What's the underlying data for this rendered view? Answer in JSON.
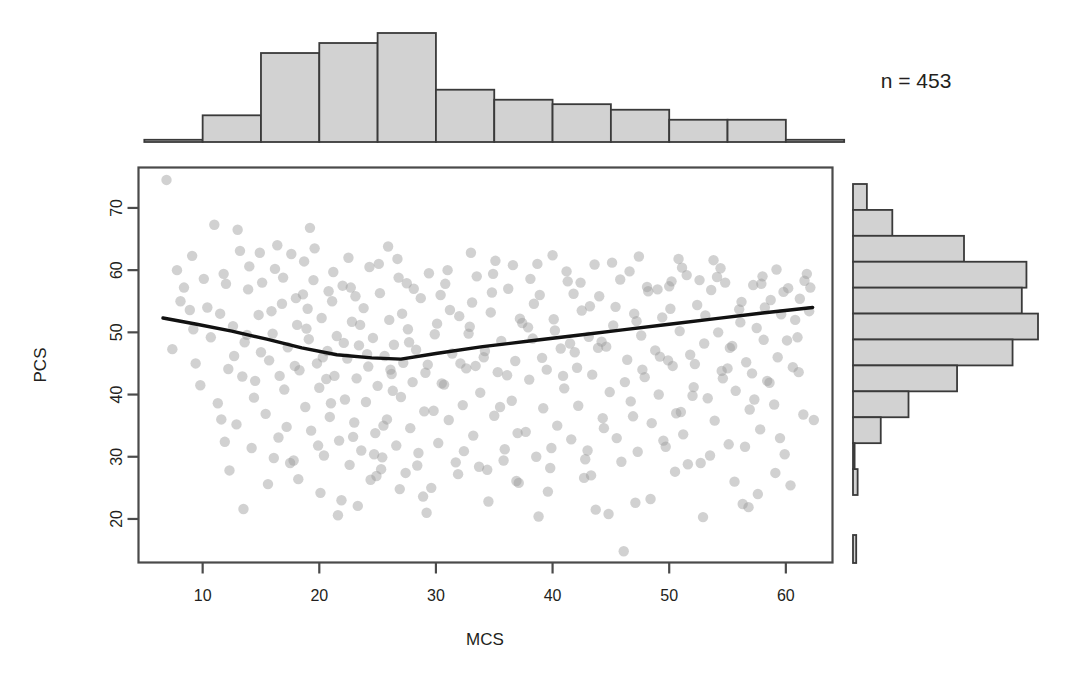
{
  "figure": {
    "annotation": "n = 453",
    "point_color": "#9a9a9a",
    "point_opacity": 0.45,
    "hist_fill": "#d2d2d2",
    "hist_stroke": "#3a3a3a",
    "axis_color": "#4a4a4a",
    "curve_color": "#111111"
  },
  "chart_data": {
    "type": "scatter",
    "title": "",
    "xlabel": "MCS",
    "ylabel": "PCS",
    "xlim": [
      4.5,
      64.0
    ],
    "ylim": [
      13.0,
      76.5
    ],
    "xticks": [
      10,
      20,
      30,
      40,
      50,
      60
    ],
    "yticks": [
      20,
      30,
      40,
      50,
      60,
      70
    ],
    "grid": false,
    "legend": null,
    "n": 453,
    "annotations": [
      {
        "text": "n = 453",
        "x": 0.88,
        "y": 0.88
      }
    ],
    "smoother": {
      "name": "loess",
      "x": [
        6.6,
        9.5,
        12.5,
        15.5,
        18.5,
        21.5,
        24.5,
        27.0,
        30.0,
        34.0,
        38.0,
        42.0,
        46.0,
        50.0,
        54.0,
        58.0,
        62.3
      ],
      "y": [
        52.3,
        51.3,
        50.2,
        48.9,
        47.5,
        46.4,
        45.9,
        45.7,
        46.6,
        47.7,
        48.6,
        49.5,
        50.4,
        51.3,
        52.2,
        53.1,
        54.0
      ]
    },
    "marginal_x": {
      "type": "histogram",
      "orientation": "top",
      "binwidth": 5,
      "bin_edges": [
        5,
        10,
        15,
        20,
        25,
        30,
        35,
        40,
        45,
        50,
        55,
        60,
        65
      ],
      "counts": [
        2,
        24,
        80,
        89,
        98,
        47,
        38,
        34,
        29,
        20,
        20,
        2
      ]
    },
    "marginal_y": {
      "type": "histogram",
      "orientation": "right",
      "binwidth": 5,
      "bin_edges": [
        15,
        20,
        25,
        30,
        35,
        40,
        45,
        50,
        55,
        60,
        65,
        70,
        75
      ],
      "counts": [
        2,
        0,
        12,
        24,
        45,
        69,
        80,
        73,
        75,
        48,
        17,
        6
      ],
      "counts_top_down": [
        6,
        17,
        48,
        75,
        73,
        80,
        69,
        45,
        24,
        12,
        0,
        2
      ]
    },
    "points": [
      [
        6.9,
        74.5
      ],
      [
        7.4,
        47.3
      ],
      [
        8.4,
        57.2
      ],
      [
        9.1,
        62.3
      ],
      [
        9.8,
        41.5
      ],
      [
        10.4,
        54.0
      ],
      [
        11.0,
        67.3
      ],
      [
        11.3,
        38.6
      ],
      [
        11.8,
        59.4
      ],
      [
        12.2,
        44.1
      ],
      [
        12.6,
        51.0
      ],
      [
        12.9,
        35.2
      ],
      [
        13.2,
        63.1
      ],
      [
        13.6,
        48.4
      ],
      [
        13.9,
        56.9
      ],
      [
        14.2,
        31.4
      ],
      [
        14.5,
        42.2
      ],
      [
        14.8,
        52.8
      ],
      [
        15.1,
        58.0
      ],
      [
        15.4,
        36.9
      ],
      [
        15.7,
        45.5
      ],
      [
        16.0,
        49.8
      ],
      [
        16.2,
        60.2
      ],
      [
        16.5,
        33.1
      ],
      [
        16.8,
        54.6
      ],
      [
        17.0,
        40.8
      ],
      [
        17.3,
        47.6
      ],
      [
        17.6,
        62.6
      ],
      [
        17.8,
        29.4
      ],
      [
        18.1,
        51.2
      ],
      [
        18.3,
        43.9
      ],
      [
        18.6,
        56.1
      ],
      [
        18.8,
        38.0
      ],
      [
        19.1,
        48.9
      ],
      [
        19.3,
        34.2
      ],
      [
        19.5,
        58.4
      ],
      [
        19.8,
        45.0
      ],
      [
        20.0,
        41.1
      ],
      [
        20.2,
        52.3
      ],
      [
        20.4,
        30.2
      ],
      [
        20.7,
        47.0
      ],
      [
        20.9,
        36.4
      ],
      [
        21.1,
        55.0
      ],
      [
        21.3,
        43.0
      ],
      [
        21.5,
        49.4
      ],
      [
        21.7,
        32.6
      ],
      [
        22.0,
        57.5
      ],
      [
        22.2,
        39.2
      ],
      [
        22.4,
        45.8
      ],
      [
        22.6,
        28.7
      ],
      [
        22.8,
        51.7
      ],
      [
        23.0,
        35.5
      ],
      [
        23.2,
        42.6
      ],
      [
        23.4,
        47.9
      ],
      [
        23.6,
        31.0
      ],
      [
        23.8,
        53.9
      ],
      [
        24.0,
        38.8
      ],
      [
        24.2,
        44.5
      ],
      [
        24.4,
        26.3
      ],
      [
        24.6,
        49.1
      ],
      [
        24.8,
        33.8
      ],
      [
        25.0,
        41.4
      ],
      [
        25.2,
        56.3
      ],
      [
        25.4,
        29.9
      ],
      [
        25.6,
        46.2
      ],
      [
        25.8,
        36.0
      ],
      [
        26.0,
        52.0
      ],
      [
        26.2,
        43.3
      ],
      [
        26.4,
        48.0
      ],
      [
        26.6,
        31.8
      ],
      [
        26.8,
        58.8
      ],
      [
        27.0,
        39.6
      ],
      [
        27.2,
        45.1
      ],
      [
        27.4,
        27.4
      ],
      [
        27.6,
        50.5
      ],
      [
        27.8,
        34.6
      ],
      [
        28.0,
        42.0
      ],
      [
        28.3,
        47.2
      ],
      [
        28.5,
        30.6
      ],
      [
        28.7,
        55.5
      ],
      [
        29.0,
        37.3
      ],
      [
        29.3,
        44.8
      ],
      [
        29.6,
        25.0
      ],
      [
        29.9,
        49.7
      ],
      [
        30.2,
        32.2
      ],
      [
        30.5,
        41.8
      ],
      [
        30.8,
        57.8
      ],
      [
        31.1,
        35.9
      ],
      [
        31.4,
        46.6
      ],
      [
        31.7,
        29.1
      ],
      [
        32.0,
        52.6
      ],
      [
        32.3,
        38.3
      ],
      [
        32.6,
        44.2
      ],
      [
        32.9,
        50.9
      ],
      [
        33.2,
        33.4
      ],
      [
        33.5,
        59.0
      ],
      [
        33.8,
        40.3
      ],
      [
        34.1,
        46.0
      ],
      [
        34.4,
        27.9
      ],
      [
        34.7,
        53.2
      ],
      [
        35.0,
        36.6
      ],
      [
        35.3,
        43.6
      ],
      [
        35.6,
        48.6
      ],
      [
        35.9,
        31.2
      ],
      [
        36.2,
        57.0
      ],
      [
        36.5,
        39.0
      ],
      [
        36.8,
        45.4
      ],
      [
        37.1,
        25.8
      ],
      [
        37.4,
        51.5
      ],
      [
        37.7,
        34.0
      ],
      [
        38.0,
        42.4
      ],
      [
        38.3,
        49.0
      ],
      [
        38.6,
        30.0
      ],
      [
        38.9,
        56.0
      ],
      [
        39.2,
        37.8
      ],
      [
        39.5,
        44.0
      ],
      [
        39.8,
        28.2
      ],
      [
        40.1,
        52.1
      ],
      [
        40.4,
        35.0
      ],
      [
        40.7,
        47.4
      ],
      [
        41.0,
        41.0
      ],
      [
        41.3,
        58.2
      ],
      [
        41.6,
        32.8
      ],
      [
        41.9,
        46.8
      ],
      [
        42.2,
        38.2
      ],
      [
        42.5,
        53.5
      ],
      [
        42.8,
        29.6
      ],
      [
        43.1,
        49.3
      ],
      [
        43.4,
        43.2
      ],
      [
        43.7,
        21.5
      ],
      [
        44.0,
        55.8
      ],
      [
        44.3,
        36.2
      ],
      [
        44.6,
        47.7
      ],
      [
        44.9,
        40.4
      ],
      [
        45.2,
        51.1
      ],
      [
        45.5,
        33.0
      ],
      [
        45.8,
        58.5
      ],
      [
        46.1,
        14.8
      ],
      [
        46.4,
        45.6
      ],
      [
        46.7,
        38.9
      ],
      [
        47.0,
        53.0
      ],
      [
        47.3,
        30.8
      ],
      [
        47.6,
        49.5
      ],
      [
        47.9,
        42.8
      ],
      [
        48.2,
        56.6
      ],
      [
        48.5,
        35.4
      ],
      [
        48.8,
        47.1
      ],
      [
        49.1,
        40.0
      ],
      [
        49.4,
        52.4
      ],
      [
        49.7,
        31.6
      ],
      [
        50.0,
        57.4
      ],
      [
        50.3,
        44.6
      ],
      [
        50.6,
        37.0
      ],
      [
        50.9,
        50.2
      ],
      [
        51.2,
        33.6
      ],
      [
        51.5,
        59.2
      ],
      [
        51.8,
        46.4
      ],
      [
        52.1,
        41.2
      ],
      [
        52.4,
        54.4
      ],
      [
        52.7,
        29.0
      ],
      [
        53.0,
        48.2
      ],
      [
        53.3,
        39.4
      ],
      [
        53.6,
        56.8
      ],
      [
        53.9,
        35.8
      ],
      [
        54.2,
        50.0
      ],
      [
        54.5,
        43.8
      ],
      [
        54.8,
        58.0
      ],
      [
        55.1,
        32.0
      ],
      [
        55.4,
        47.8
      ],
      [
        55.7,
        40.6
      ],
      [
        56.0,
        53.7
      ],
      [
        56.3,
        22.4
      ],
      [
        56.6,
        45.2
      ],
      [
        56.9,
        37.6
      ],
      [
        57.2,
        57.6
      ],
      [
        57.5,
        50.7
      ],
      [
        57.8,
        34.4
      ],
      [
        58.1,
        48.8
      ],
      [
        58.4,
        42.2
      ],
      [
        58.7,
        55.2
      ],
      [
        59.0,
        38.4
      ],
      [
        59.3,
        46.0
      ],
      [
        59.6,
        52.9
      ],
      [
        59.9,
        30.4
      ],
      [
        60.2,
        57.1
      ],
      [
        60.6,
        44.4
      ],
      [
        61.0,
        49.2
      ],
      [
        61.5,
        36.8
      ],
      [
        62.0,
        53.4
      ],
      [
        62.4,
        35.9
      ],
      [
        8.9,
        53.6
      ],
      [
        10.7,
        49.2
      ],
      [
        12.0,
        57.8
      ],
      [
        13.4,
        42.9
      ],
      [
        14.0,
        60.6
      ],
      [
        15.0,
        46.8
      ],
      [
        15.9,
        53.4
      ],
      [
        16.9,
        58.8
      ],
      [
        17.9,
        44.6
      ],
      [
        18.9,
        50.6
      ],
      [
        19.6,
        63.5
      ],
      [
        20.6,
        42.5
      ],
      [
        21.2,
        59.7
      ],
      [
        22.1,
        48.3
      ],
      [
        23.1,
        55.8
      ],
      [
        24.1,
        46.5
      ],
      [
        25.1,
        61.0
      ],
      [
        26.1,
        44.0
      ],
      [
        27.1,
        53.0
      ],
      [
        28.1,
        57.0
      ],
      [
        29.1,
        43.5
      ],
      [
        30.1,
        51.4
      ],
      [
        31.0,
        60.0
      ],
      [
        32.1,
        45.0
      ],
      [
        33.1,
        54.8
      ],
      [
        34.2,
        47.0
      ],
      [
        35.1,
        61.5
      ],
      [
        36.1,
        43.1
      ],
      [
        37.2,
        52.2
      ],
      [
        38.1,
        58.6
      ],
      [
        39.1,
        45.9
      ],
      [
        40.2,
        50.3
      ],
      [
        41.2,
        59.8
      ],
      [
        42.1,
        44.3
      ],
      [
        43.2,
        54.2
      ],
      [
        44.2,
        48.5
      ],
      [
        45.1,
        61.2
      ],
      [
        46.2,
        42.0
      ],
      [
        47.2,
        51.8
      ],
      [
        48.1,
        57.3
      ],
      [
        49.2,
        46.1
      ],
      [
        50.1,
        53.8
      ],
      [
        51.1,
        60.4
      ],
      [
        52.2,
        44.9
      ],
      [
        53.1,
        52.7
      ],
      [
        54.1,
        58.9
      ],
      [
        55.2,
        47.5
      ],
      [
        56.1,
        51.6
      ],
      [
        57.1,
        43.4
      ],
      [
        58.2,
        54.0
      ],
      [
        59.2,
        60.1
      ],
      [
        60.1,
        48.7
      ],
      [
        61.2,
        55.4
      ],
      [
        62.1,
        57.2
      ],
      [
        7.8,
        60.0
      ],
      [
        9.4,
        45.0
      ],
      [
        11.5,
        53.0
      ],
      [
        13.0,
        66.5
      ],
      [
        14.4,
        39.5
      ],
      [
        16.4,
        64.0
      ],
      [
        18.0,
        55.5
      ],
      [
        19.2,
        66.8
      ],
      [
        20.8,
        56.6
      ],
      [
        22.5,
        62.0
      ],
      [
        24.3,
        60.5
      ],
      [
        25.9,
        63.8
      ],
      [
        27.5,
        57.9
      ],
      [
        29.4,
        59.5
      ],
      [
        31.2,
        53.6
      ],
      [
        33.0,
        62.8
      ],
      [
        34.8,
        56.4
      ],
      [
        36.6,
        60.8
      ],
      [
        38.4,
        54.6
      ],
      [
        40.0,
        62.4
      ],
      [
        41.8,
        56.2
      ],
      [
        43.6,
        60.9
      ],
      [
        45.4,
        54.1
      ],
      [
        47.4,
        62.2
      ],
      [
        49.0,
        56.9
      ],
      [
        50.8,
        61.8
      ],
      [
        52.6,
        58.4
      ],
      [
        54.4,
        60.3
      ],
      [
        56.2,
        54.9
      ],
      [
        58.0,
        59.0
      ],
      [
        59.8,
        56.5
      ],
      [
        61.6,
        58.3
      ],
      [
        12.3,
        27.8
      ],
      [
        15.6,
        25.6
      ],
      [
        18.2,
        26.4
      ],
      [
        20.1,
        24.2
      ],
      [
        21.9,
        23.0
      ],
      [
        23.3,
        22.1
      ],
      [
        24.9,
        26.9
      ],
      [
        26.9,
        24.8
      ],
      [
        28.9,
        23.6
      ],
      [
        31.9,
        27.2
      ],
      [
        34.5,
        22.8
      ],
      [
        36.9,
        26.1
      ],
      [
        39.6,
        24.4
      ],
      [
        42.7,
        26.6
      ],
      [
        44.8,
        20.8
      ],
      [
        48.4,
        23.2
      ],
      [
        50.5,
        27.6
      ],
      [
        52.9,
        20.3
      ],
      [
        55.6,
        26.0
      ],
      [
        57.6,
        24.0
      ],
      [
        60.4,
        25.4
      ],
      [
        10.1,
        58.6
      ],
      [
        11.6,
        36.0
      ],
      [
        13.8,
        49.6
      ],
      [
        16.6,
        43.0
      ],
      [
        19.0,
        53.8
      ],
      [
        21.0,
        38.6
      ],
      [
        23.5,
        51.2
      ],
      [
        25.5,
        35.0
      ],
      [
        27.7,
        48.4
      ],
      [
        30.7,
        41.6
      ],
      [
        32.8,
        49.8
      ],
      [
        35.5,
        38.0
      ],
      [
        37.9,
        50.8
      ],
      [
        40.9,
        43.0
      ],
      [
        43.9,
        47.5
      ],
      [
        46.9,
        36.5
      ],
      [
        49.9,
        45.5
      ],
      [
        52.0,
        39.8
      ],
      [
        55.0,
        44.2
      ],
      [
        58.6,
        41.9
      ],
      [
        61.1,
        43.6
      ],
      [
        9.2,
        50.5
      ],
      [
        12.7,
        46.2
      ],
      [
        17.2,
        34.8
      ],
      [
        20.3,
        46.0
      ],
      [
        22.9,
        33.2
      ],
      [
        26.3,
        40.6
      ],
      [
        29.8,
        37.4
      ],
      [
        33.4,
        44.6
      ],
      [
        37.0,
        33.8
      ],
      [
        41.5,
        48.2
      ],
      [
        44.4,
        34.6
      ],
      [
        47.7,
        44.0
      ],
      [
        51.0,
        37.2
      ],
      [
        54.6,
        42.6
      ],
      [
        57.3,
        39.2
      ],
      [
        60.8,
        52.0
      ],
      [
        11.9,
        32.4
      ],
      [
        16.1,
        29.8
      ],
      [
        19.9,
        31.8
      ],
      [
        24.7,
        30.4
      ],
      [
        28.4,
        28.6
      ],
      [
        32.4,
        30.9
      ],
      [
        35.8,
        29.4
      ],
      [
        39.9,
        31.4
      ],
      [
        43.0,
        31.0
      ],
      [
        45.9,
        29.2
      ],
      [
        49.5,
        32.6
      ],
      [
        53.5,
        30.2
      ],
      [
        56.5,
        31.6
      ],
      [
        59.5,
        33.0
      ],
      [
        8.1,
        55.0
      ],
      [
        14.9,
        62.8
      ],
      [
        18.7,
        61.4
      ],
      [
        22.7,
        57.2
      ],
      [
        26.7,
        61.8
      ],
      [
        30.4,
        56.0
      ],
      [
        34.9,
        59.4
      ],
      [
        38.7,
        61.0
      ],
      [
        42.4,
        58.0
      ],
      [
        46.6,
        59.8
      ],
      [
        50.2,
        58.2
      ],
      [
        53.8,
        61.6
      ],
      [
        57.9,
        57.8
      ],
      [
        61.8,
        59.4
      ],
      [
        13.5,
        21.6
      ],
      [
        17.5,
        29.0
      ],
      [
        21.6,
        20.6
      ],
      [
        25.3,
        28.0
      ],
      [
        29.2,
        21.0
      ],
      [
        33.7,
        28.4
      ],
      [
        38.8,
        20.4
      ],
      [
        43.3,
        27.0
      ],
      [
        47.1,
        22.6
      ],
      [
        51.6,
        28.8
      ],
      [
        56.8,
        21.9
      ],
      [
        59.1,
        27.4
      ]
    ]
  }
}
